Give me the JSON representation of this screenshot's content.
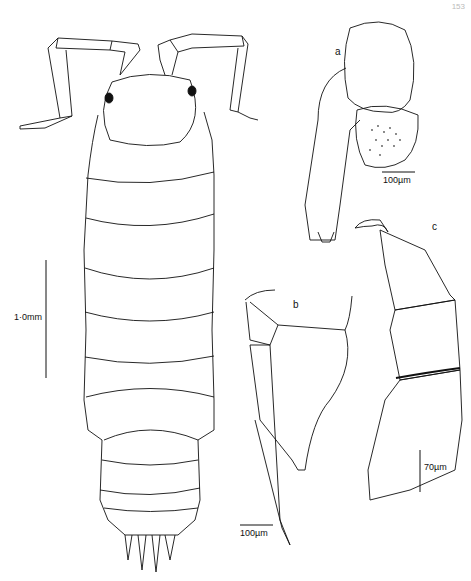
{
  "figure": {
    "page_number": "153",
    "panels": {
      "habitus": {
        "scale_label": "1·0mm"
      },
      "a": {
        "label": "a",
        "scale_label": "100µm"
      },
      "b": {
        "label": "b",
        "scale_label": "100µm"
      },
      "c": {
        "label": "c",
        "scale_label": "70µm"
      }
    },
    "colors": {
      "ink": "#111111",
      "paper": "#ffffff",
      "stipple": "#555555"
    }
  }
}
